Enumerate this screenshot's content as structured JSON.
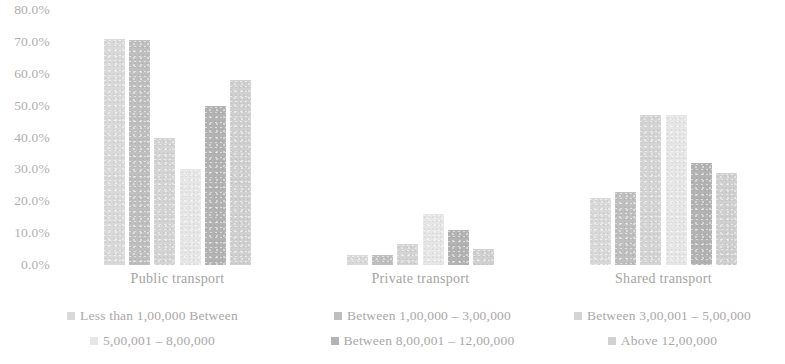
{
  "chart_data": {
    "type": "bar",
    "title": "",
    "subtitle": "",
    "xlabel": "",
    "ylabel": "",
    "categories": [
      "Public transport",
      "Private transport",
      "Shared transport"
    ],
    "ylim": [
      0,
      80
    ],
    "y_ticks": [
      "0.0%",
      "10.0%",
      "20.0%",
      "30.0%",
      "40.0%",
      "50.0%",
      "60.0%",
      "70.0%",
      "80.0%"
    ],
    "y_tick_values": [
      0,
      10,
      20,
      30,
      40,
      50,
      60,
      70,
      80
    ],
    "grid": false,
    "legend_position": "bottom",
    "series": [
      {
        "name": "Less than 1,00,000 Between",
        "color": "#d9d9d9",
        "values": [
          71.0,
          3.0,
          21.0
        ]
      },
      {
        "name": "Between 1,00,000 – 3,00,000",
        "color": "#bfbfbf",
        "values": [
          70.5,
          3.0,
          23.0
        ]
      },
      {
        "name": "Between 3,00,001 – 5,00,000",
        "color": "#d4d4d4",
        "values": [
          40.0,
          6.5,
          47.0
        ]
      },
      {
        "name": "5,00,001 – 8,00,000",
        "color": "#e6e6e6",
        "values": [
          30.0,
          16.0,
          47.0
        ]
      },
      {
        "name": "Between 8,00,001 –   12,00,000",
        "color": "#b3b3b3",
        "values": [
          50.0,
          11.0,
          32.0
        ]
      },
      {
        "name": "Above 12,00,000",
        "color": "#d0d0d0",
        "values": [
          58.0,
          5.0,
          29.0
        ]
      }
    ]
  },
  "legend": {
    "rows": [
      [
        {
          "label": "Less than 1,00,000 Between",
          "color": "#d9d9d9"
        },
        {
          "label": "Between 1,00,000 – 3,00,000",
          "color": "#bfbfbf"
        },
        {
          "label": "Between 3,00,001 – 5,00,000",
          "color": "#d4d4d4"
        }
      ],
      [
        {
          "label": "5,00,001 – 8,00,000",
          "color": "#e6e6e6"
        },
        {
          "label": "Between 8,00,001 –   12,00,000",
          "color": "#b3b3b3"
        },
        {
          "label": "Above 12,00,000",
          "color": "#d0d0d0"
        }
      ]
    ]
  }
}
